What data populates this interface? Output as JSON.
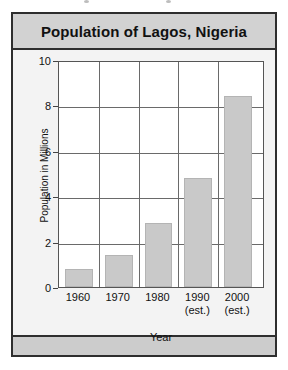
{
  "figure": {
    "title": "Population of Lagos, Nigeria"
  },
  "chart_data": {
    "type": "bar",
    "title": "Population of Lagos, Nigeria",
    "xlabel": "Year",
    "ylabel": "Population in Millions",
    "categories": [
      "1960",
      "1970",
      "1980",
      "1990",
      "2000"
    ],
    "category_notes": [
      "",
      "",
      "",
      "(est.)",
      "(est.)"
    ],
    "values": [
      0.8,
      1.4,
      2.8,
      4.8,
      8.4
    ],
    "ylim": [
      0,
      10
    ],
    "yticks": [
      0,
      2,
      4,
      6,
      8,
      10
    ],
    "ytick_labels": [
      "0",
      "2",
      "4",
      "6",
      "8",
      "10"
    ],
    "grid": true,
    "legend": "none",
    "bar_color": "#c9c9c9",
    "panel_color": "#ffffff",
    "title_bar_color": "#d2d2d2",
    "border_color": "#2e2e2e"
  }
}
